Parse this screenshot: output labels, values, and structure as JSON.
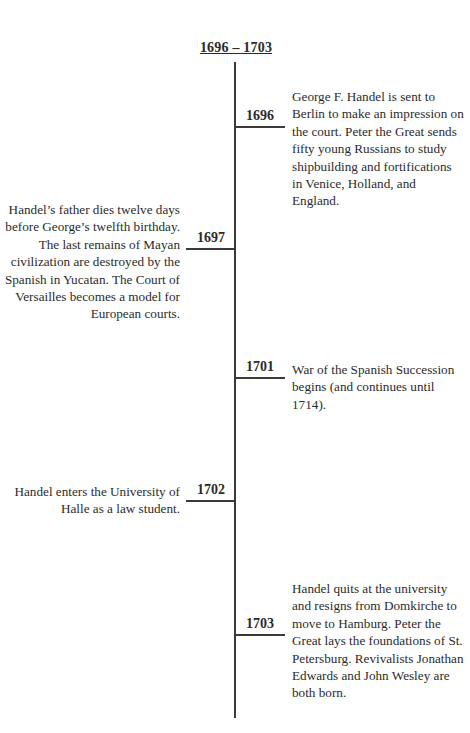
{
  "timeline": {
    "title": "1696 – 1703",
    "entries": [
      {
        "year": "1696",
        "side": "right",
        "text": "George F. Handel is sent to Berlin to make an impression on the court. Peter the Great sends fifty young Russians to study shipbuilding and fortifications in Venice, Holland, and England."
      },
      {
        "year": "1697",
        "side": "left",
        "text": "Handel’s father dies twelve days before George’s twelfth birthday. The last remains of Mayan civilization are destroyed by the Spanish in Yucatan. The Court of Versailles becomes a model for European courts."
      },
      {
        "year": "1701",
        "side": "right",
        "text": "War of the Spanish Succession begins (and continues until 1714)."
      },
      {
        "year": "1702",
        "side": "left",
        "text": "Handel enters the University of Halle as a law student."
      },
      {
        "year": "1703",
        "side": "right",
        "text": "Handel quits at the university and resigns from Domkirche to move to Hamburg. Peter the Great lays the foundations of St. Petersburg. Revivalists Jonathan Edwards and John Wesley are both born."
      }
    ]
  }
}
